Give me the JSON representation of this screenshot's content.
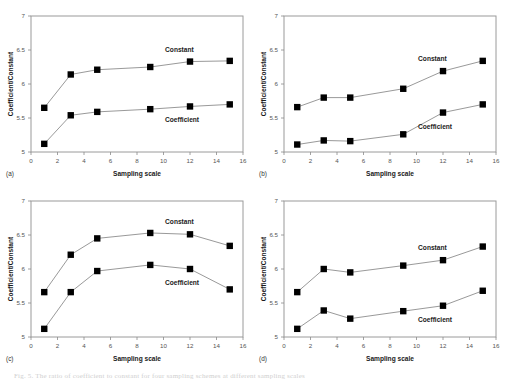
{
  "figure": {
    "panel_tags": [
      "(a)",
      "(b)",
      "(c)",
      "(d)"
    ],
    "caption_fragment": "Fig. 5. The ratio of coefficient to constant for four sampling schemes at different sampling scales"
  },
  "axes": {
    "xlabel": "Sampling scale",
    "ylabel": "Coefficient/Constant",
    "xticks": [
      "0",
      "2",
      "4",
      "6",
      "8",
      "10",
      "12",
      "14",
      "16"
    ],
    "yticks": [
      "5",
      "5.5",
      "6",
      "6.5",
      "7"
    ],
    "xlim": [
      0,
      16
    ],
    "ylim": [
      5,
      7
    ]
  },
  "series_labels": {
    "constant": "Constant",
    "coefficient": "Coefficient"
  },
  "colors": {
    "marker": "#000000",
    "line": "#8d8d8d",
    "frame": "#9a9a9a",
    "text": "#1a1a1a"
  },
  "chart_data": [
    {
      "type": "line",
      "panel": "(a)",
      "title": "",
      "xlabel": "Sampling scale",
      "ylabel": "Coefficient/Constant",
      "xlim": [
        0,
        16
      ],
      "ylim": [
        5,
        7
      ],
      "grid": false,
      "legend_position": "inline-annotation",
      "x": [
        1,
        3,
        5,
        9,
        12,
        15
      ],
      "series": [
        {
          "name": "Constant",
          "values": [
            5.65,
            6.14,
            6.21,
            6.25,
            6.33,
            6.34
          ]
        },
        {
          "name": "Coefficient",
          "values": [
            5.12,
            5.54,
            5.59,
            5.63,
            5.67,
            5.7
          ]
        }
      ]
    },
    {
      "type": "line",
      "panel": "(b)",
      "title": "",
      "xlabel": "Sampling scale",
      "ylabel": "Coefficient/Constant",
      "xlim": [
        0,
        16
      ],
      "ylim": [
        5,
        7
      ],
      "grid": false,
      "legend_position": "inline-annotation",
      "x": [
        1,
        3,
        5,
        9,
        12,
        15
      ],
      "series": [
        {
          "name": "Constant",
          "values": [
            5.66,
            5.8,
            5.8,
            5.93,
            6.19,
            6.34
          ]
        },
        {
          "name": "Coefficient",
          "values": [
            5.11,
            5.17,
            5.16,
            5.26,
            5.58,
            5.7
          ]
        }
      ]
    },
    {
      "type": "line",
      "panel": "(c)",
      "title": "",
      "xlabel": "Sampling scale",
      "ylabel": "Coefficient/Constant",
      "xlim": [
        0,
        16
      ],
      "ylim": [
        5,
        7
      ],
      "grid": false,
      "legend_position": "inline-annotation",
      "x": [
        1,
        3,
        5,
        9,
        12,
        15
      ],
      "series": [
        {
          "name": "Constant",
          "values": [
            5.66,
            6.21,
            6.45,
            6.53,
            6.51,
            6.34
          ]
        },
        {
          "name": "Coefficient",
          "values": [
            5.12,
            5.66,
            5.97,
            6.06,
            6.0,
            5.7
          ]
        }
      ]
    },
    {
      "type": "line",
      "panel": "(d)",
      "title": "",
      "xlabel": "Sampling scale",
      "ylabel": "Coefficient/Constant",
      "xlim": [
        0,
        16
      ],
      "ylim": [
        5,
        7
      ],
      "grid": false,
      "legend_position": "inline-annotation",
      "x": [
        1,
        3,
        5,
        9,
        12,
        15
      ],
      "series": [
        {
          "name": "Constant",
          "values": [
            5.66,
            6.0,
            5.95,
            6.05,
            6.13,
            6.33
          ]
        },
        {
          "name": "Coefficient",
          "values": [
            5.12,
            5.39,
            5.27,
            5.38,
            5.46,
            5.68
          ]
        }
      ]
    }
  ]
}
